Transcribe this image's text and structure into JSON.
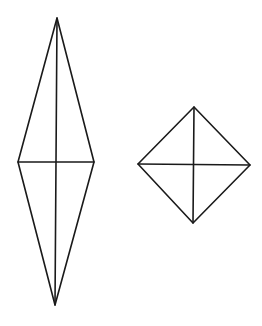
{
  "canvas": {
    "width": 262,
    "height": 326,
    "background": "#ffffff",
    "stroke": "#1a1a1a"
  },
  "shapes": [
    {
      "name": "elongated-rhombus",
      "vertices": {
        "top": [
          57,
          18
        ],
        "right": [
          94,
          162
        ],
        "bottom": [
          55,
          305
        ],
        "left": [
          18,
          162
        ]
      },
      "diagonals": true
    },
    {
      "name": "square-rhombus",
      "vertices": {
        "top": [
          194,
          107
        ],
        "right": [
          250,
          165
        ],
        "bottom": [
          193,
          223
        ],
        "left": [
          138,
          164
        ]
      },
      "diagonals": true
    }
  ]
}
